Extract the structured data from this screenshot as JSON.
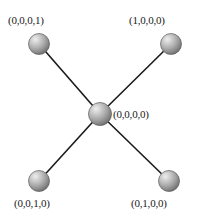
{
  "diagram": {
    "type": "star-graph",
    "background_color": "#ffffff",
    "edge_color": "#1a1a1a",
    "edge_width": 1.6,
    "node_style": {
      "shape": "sphere",
      "highlight_color": "#e2e2e2",
      "mid_color": "#a6a6a6",
      "shadow_color": "#6b6b6b",
      "outline_color": "#4a4a4a"
    },
    "nodes": [
      {
        "id": "center",
        "label": "(0,0,0,0)",
        "cx": 100,
        "cy": 114,
        "r": 11.5,
        "label_position": "right"
      },
      {
        "id": "top-left",
        "label": "(0,0,0,1)",
        "cx": 39,
        "cy": 44,
        "r": 10.5,
        "label_position": "above"
      },
      {
        "id": "top-right",
        "label": "(1,0,0,0)",
        "cx": 171,
        "cy": 44,
        "r": 10.5,
        "label_position": "above"
      },
      {
        "id": "bottom-left",
        "label": "(0,0,1,0)",
        "cx": 39,
        "cy": 181,
        "r": 10.5,
        "label_position": "below"
      },
      {
        "id": "bottom-right",
        "label": "(0,1,0,0)",
        "cx": 169,
        "cy": 181,
        "r": 10.5,
        "label_position": "below"
      }
    ],
    "edges": [
      {
        "from": "center",
        "to": "top-left"
      },
      {
        "from": "center",
        "to": "top-right"
      },
      {
        "from": "center",
        "to": "bottom-left"
      },
      {
        "from": "center",
        "to": "bottom-right"
      }
    ]
  }
}
